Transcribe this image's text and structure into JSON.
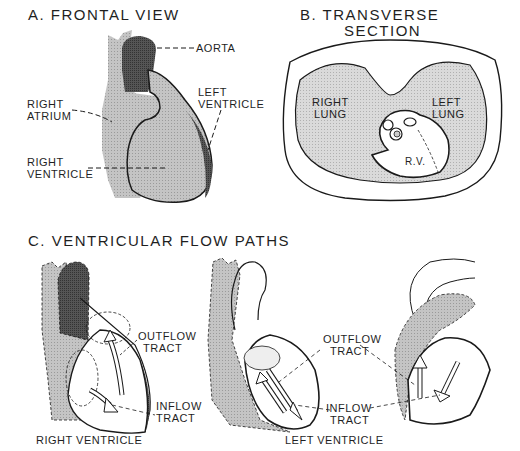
{
  "panel_a": {
    "title": "A. FRONTAL VIEW",
    "labels": {
      "aorta": "AORTA",
      "left_ventricle_1": "LEFT",
      "left_ventricle_2": "VENTRICLE",
      "right_atrium_1": "RIGHT",
      "right_atrium_2": "ATRIUM",
      "right_ventricle_1": "RIGHT",
      "right_ventricle_2": "VENTRICLE"
    }
  },
  "panel_b": {
    "title_1": "B. TRANSVERSE",
    "title_2": "SECTION",
    "labels": {
      "right_lung_1": "RIGHT",
      "right_lung_2": "LUNG",
      "left_lung_1": "LEFT",
      "left_lung_2": "LUNG",
      "rv": "R.V."
    }
  },
  "panel_c": {
    "title": "C. VENTRICULAR FLOW PATHS",
    "right": {
      "outflow_1": "OUTFLOW",
      "outflow_2": "TRACT",
      "inflow_1": "INFLOW",
      "inflow_2": "TRACT",
      "caption": "RIGHT VENTRICLE"
    },
    "left": {
      "outflow_1": "OUTFLOW",
      "outflow_2": "TRACT",
      "inflow_1": "INFLOW",
      "inflow_2": "TRACT",
      "caption": "LEFT VENTRICLE"
    }
  },
  "colors": {
    "light_fill": "#bdbdbd",
    "dark_fill": "#4a4a4a",
    "lung_fill": "#d4d4d4",
    "line": "#1a1a1a"
  }
}
